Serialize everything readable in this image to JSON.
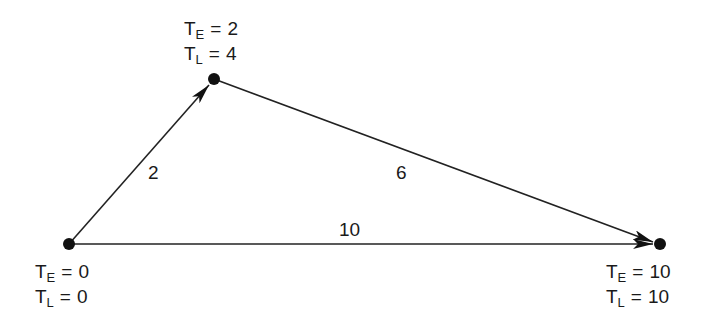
{
  "diagram": {
    "type": "activity-network",
    "nodes": [
      {
        "id": "start",
        "te_label": "T",
        "te_sub": "E",
        "te_value": "0",
        "tl_label": "T",
        "tl_sub": "L",
        "tl_value": "0"
      },
      {
        "id": "middle",
        "te_label": "T",
        "te_sub": "E",
        "te_value": "2",
        "tl_label": "T",
        "tl_sub": "L",
        "tl_value": "4"
      },
      {
        "id": "end",
        "te_label": "T",
        "te_sub": "E",
        "te_value": "10",
        "tl_label": "T",
        "tl_sub": "L",
        "tl_value": "10"
      }
    ],
    "edges": [
      {
        "from": "start",
        "to": "middle",
        "duration": "2"
      },
      {
        "from": "middle",
        "to": "end",
        "duration": "6"
      },
      {
        "from": "start",
        "to": "end",
        "duration": "10"
      }
    ],
    "equals": "="
  }
}
